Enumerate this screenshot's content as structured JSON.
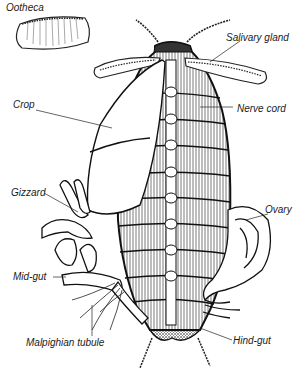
{
  "diagram": {
    "labels": {
      "ootheca": "Ootheca",
      "salivary_gland": "Salivary gland",
      "crop": "Crop",
      "nerve_cord": "Nerve cord",
      "gizzard": "Gizzard",
      "ovary": "Ovary",
      "mid_gut": "Mid-gut",
      "malpighian_tubule": "Malpighian tubule",
      "hind_gut": "Hind-gut"
    },
    "colors": {
      "ink": "#1a1a1a",
      "background": "#ffffff"
    }
  }
}
